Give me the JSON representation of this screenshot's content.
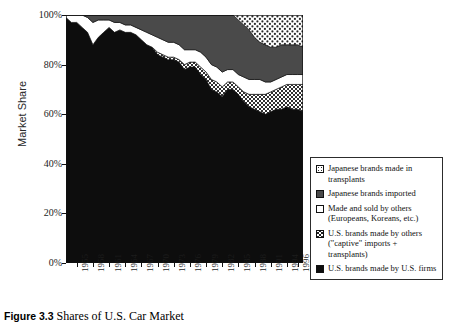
{
  "figure": {
    "number_label": "Figure 3.3",
    "caption_text": "Shares of U.S. Car Market"
  },
  "axes": {
    "ylabel": "Market Share",
    "xlabel": "",
    "yticks": [
      "0%",
      "20%",
      "40%",
      "60%",
      "80%",
      "100%"
    ],
    "ytick_values": [
      0,
      20,
      40,
      60,
      80,
      100
    ],
    "xticks": [
      "1955",
      "1958",
      "1961",
      "1964",
      "1967",
      "1970",
      "1973",
      "1976",
      "1979",
      "1982",
      "1985",
      "1988",
      "1991",
      "1994",
      "1996"
    ]
  },
  "legend": {
    "items": [
      {
        "swatch": "dotted-pattern-swatch",
        "label": "Japanese brands made in transplants"
      },
      {
        "swatch": "dark-gray-swatch",
        "label": "Japanese brands imported"
      },
      {
        "swatch": "white-swatch",
        "label": "Made and sold by others (Europeans, Koreans, etc.)"
      },
      {
        "swatch": "crosshatch-swatch",
        "label": "U.S. brands made by others (\"captive\" imports + transplants)"
      },
      {
        "swatch": "black-swatch",
        "label": "U.S. brands made by U.S. firms"
      }
    ]
  },
  "colors": {
    "black": "#0d0d0d",
    "crosshatch_base": "#d9d9d9",
    "white": "#ffffff",
    "dark_gray": "#4a4a4a",
    "dots_base": "#ffffff",
    "axis": "#111111"
  },
  "chart_data": {
    "type": "area",
    "title": "Shares of U.S. Car Market",
    "xlabel": "",
    "ylabel": "Market Share",
    "ylim": [
      0,
      100
    ],
    "grid": false,
    "legend_position": "right",
    "stacked": true,
    "x": [
      1953,
      1954,
      1955,
      1956,
      1957,
      1958,
      1959,
      1960,
      1961,
      1962,
      1963,
      1964,
      1965,
      1966,
      1967,
      1968,
      1969,
      1970,
      1971,
      1972,
      1973,
      1974,
      1975,
      1976,
      1977,
      1978,
      1979,
      1980,
      1981,
      1982,
      1983,
      1984,
      1985,
      1986,
      1987,
      1988,
      1989,
      1990,
      1991,
      1992,
      1993,
      1994,
      1995,
      1996,
      1997
    ],
    "series": [
      {
        "name": "U.S. brands made by U.S. firms",
        "swatch": "black-swatch",
        "values": [
          99,
          97,
          97,
          95,
          93,
          88,
          91,
          93,
          95,
          93,
          94,
          93,
          93,
          92,
          90,
          88,
          87,
          84,
          83,
          82,
          82,
          81,
          78,
          79,
          79,
          76,
          74,
          70,
          69,
          67,
          70,
          70,
          68,
          65,
          63,
          62,
          61,
          60,
          61,
          62,
          62,
          63,
          62,
          62,
          61
        ]
      },
      {
        "name": "U.S. brands made by others (\"captive\" imports + transplants)",
        "swatch": "crosshatch-swatch",
        "values": [
          0,
          0,
          0,
          0,
          0,
          0,
          0,
          0,
          0,
          0,
          0,
          0,
          0,
          0,
          0,
          0,
          0,
          1,
          1,
          1,
          1,
          1,
          2,
          2,
          2,
          3,
          3,
          4,
          4,
          4,
          3,
          3,
          3,
          4,
          5,
          6,
          7,
          8,
          8,
          8,
          9,
          9,
          10,
          10,
          11
        ]
      },
      {
        "name": "Made and sold by others (Europeans, Koreans, etc.)",
        "swatch": "white-swatch",
        "values": [
          1,
          3,
          3,
          5,
          6,
          9,
          7,
          5,
          3,
          4,
          3,
          3,
          3,
          3,
          4,
          5,
          5,
          6,
          6,
          6,
          6,
          6,
          6,
          5,
          5,
          6,
          6,
          6,
          6,
          6,
          5,
          5,
          5,
          6,
          6,
          6,
          6,
          5,
          4,
          4,
          4,
          4,
          4,
          4,
          4
        ]
      },
      {
        "name": "Japanese brands imported",
        "swatch": "dark-gray-swatch",
        "values": [
          0,
          0,
          0,
          0,
          1,
          3,
          2,
          2,
          2,
          3,
          3,
          4,
          4,
          5,
          6,
          7,
          8,
          9,
          10,
          11,
          11,
          12,
          14,
          14,
          14,
          15,
          17,
          20,
          21,
          23,
          22,
          22,
          22,
          21,
          20,
          17,
          15,
          15,
          14,
          13,
          13,
          12,
          12,
          12,
          11
        ]
      },
      {
        "name": "Japanese brands made in transplants",
        "swatch": "dotted-pattern-swatch",
        "values": [
          0,
          0,
          0,
          0,
          0,
          0,
          0,
          0,
          0,
          0,
          0,
          0,
          0,
          0,
          0,
          0,
          0,
          0,
          0,
          0,
          0,
          0,
          0,
          0,
          0,
          0,
          0,
          0,
          0,
          0,
          0,
          0,
          2,
          4,
          6,
          9,
          11,
          12,
          13,
          13,
          12,
          12,
          12,
          12,
          13
        ]
      }
    ]
  }
}
